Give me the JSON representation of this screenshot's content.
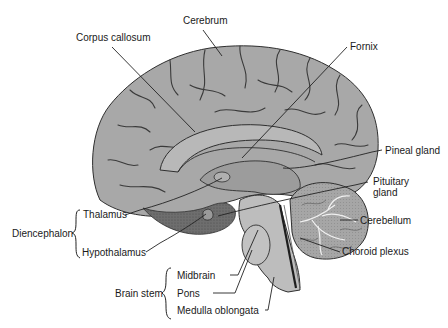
{
  "diagram": {
    "colors": {
      "cortex": "#a9a9a9",
      "cortex_dark": "#7a7a7a",
      "sulcus": "#3a3a3a",
      "brainstem": "#bdbdbd",
      "cerebellum": "#8e8e8e",
      "leader": "#222222",
      "text": "#1a1a1a"
    },
    "labels": {
      "cerebrum": "Cerebrum",
      "corpus_callosum": "Corpus callosum",
      "fornix": "Fornix",
      "pineal_gland": "Pineal gland",
      "pituitary_gland_1": "Pituitary",
      "pituitary_gland_2": "gland",
      "cerebellum": "Cerebellum",
      "choroid_plexus": "Choroid plexus",
      "thalamus": "Thalamus",
      "hypothalamus": "Hypothalamus",
      "diencephalon": "Diencephalon",
      "brain_stem": "Brain stem",
      "midbrain": "Midbrain",
      "pons": "Pons",
      "medulla_oblongata": "Medulla oblongata"
    },
    "groups": [
      {
        "name": "Diencephalon",
        "members": [
          "Thalamus",
          "Hypothalamus"
        ]
      },
      {
        "name": "Brain stem",
        "members": [
          "Midbrain",
          "Pons",
          "Medulla oblongata"
        ]
      }
    ]
  }
}
